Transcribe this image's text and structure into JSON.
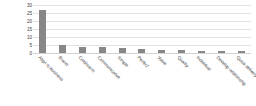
{
  "chart_data": {
    "type": "bar",
    "title": "",
    "subtitle": "",
    "xlabel": "",
    "ylabel": "",
    "ylim": [
      0,
      30
    ],
    "yticks": [
      30,
      25,
      20,
      15,
      10,
      5,
      0
    ],
    "grid": true,
    "legend": false,
    "legend_position": "none",
    "bar_color": "#878787",
    "categories": [
      "Align to business",
      "Brand",
      "Cold/warm",
      "Communicative",
      "Simple",
      "Perfect",
      "Value",
      "Quality",
      "Individual",
      "Develop relationship",
      "Quick delivery"
    ],
    "values": [
      27,
      5,
      4,
      3.5,
      3,
      2.5,
      2,
      2,
      1.2,
      1,
      1
    ],
    "series": [
      {
        "name": "Responses",
        "values": [
          27,
          5,
          4,
          3.5,
          3,
          2.5,
          2,
          2,
          1.2,
          1,
          1
        ]
      }
    ]
  }
}
